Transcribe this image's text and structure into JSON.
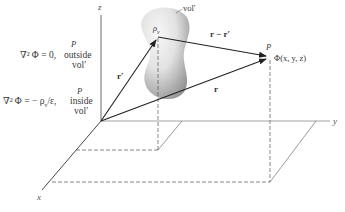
{
  "axes": {
    "x_label": "x",
    "y_label": "y",
    "z_label": "z"
  },
  "source": {
    "density_label": "ρ",
    "density_subscript": "v",
    "volume_label": "vol′"
  },
  "vectors": {
    "r_prime": "r′",
    "r": "r",
    "r_minus_r_prime": "r − r′"
  },
  "field_point": {
    "point_label": "P",
    "potential_label": "Φ(x, y, z)"
  },
  "equations": {
    "outside": {
      "point_label": "P",
      "lhs": "∇² Φ = 0,",
      "region": "outside",
      "volume": "vol′"
    },
    "inside": {
      "point_label": "P",
      "lhs": "∇² Φ = − ρ",
      "subscript": "v",
      "rhs": "/ε,",
      "region": "inside",
      "volume": "vol′"
    }
  },
  "colors": {
    "line": "#2b2b2b",
    "dashed": "#555555",
    "blob_dark": "#8a8a8a",
    "blob_light": "#f2f2f2"
  }
}
